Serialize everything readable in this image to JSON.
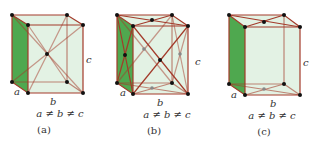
{
  "figure": {
    "panels": [
      {
        "id": "a",
        "caption": "(a)",
        "relation": "a ≠ b ≠ c",
        "axis_labels": {
          "a": "a",
          "b": "b",
          "c": "c"
        },
        "lattice": "body-centered"
      },
      {
        "id": "b",
        "caption": "(b)",
        "relation": "a ≠ b ≠ c",
        "axis_labels": {
          "a": "a",
          "b": "b",
          "c": "c"
        },
        "lattice": "face-centered"
      },
      {
        "id": "c",
        "caption": "(c)",
        "relation": "a ≠ b ≠ c",
        "axis_labels": {
          "a": "a",
          "b": "b",
          "c": "c"
        },
        "lattice": "base-centered"
      }
    ],
    "colors": {
      "edge": "#a33a2a",
      "face": "#d9eedb",
      "side_face": "#4fa84f",
      "atom": "#111111"
    }
  }
}
